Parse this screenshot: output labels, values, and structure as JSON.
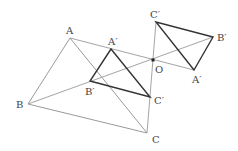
{
  "diagram": {
    "type": "geometry-homothety",
    "center": {
      "label": "O",
      "x": 153,
      "y": 60
    },
    "original_triangle": {
      "A": {
        "label": "A",
        "x": 70,
        "y": 38
      },
      "B": {
        "label": "B",
        "x": 28,
        "y": 104
      },
      "C": {
        "label": "C",
        "x": 147,
        "y": 133
      }
    },
    "inner_image": {
      "A": {
        "label": "A′",
        "x": 111,
        "y": 49
      },
      "B": {
        "label": "B′",
        "x": 90,
        "y": 81
      },
      "C": {
        "label": "C′",
        "x": 150,
        "y": 97
      }
    },
    "outer_image": {
      "A": {
        "label": "A′",
        "x": 194,
        "y": 70
      },
      "B": {
        "label": "B′",
        "x": 213,
        "y": 37
      },
      "C": {
        "label": "C′",
        "x": 156,
        "y": 22
      }
    },
    "colors": {
      "thin_line": "#9a9a9a",
      "thick_line": "#333333",
      "point": "#222222"
    }
  }
}
